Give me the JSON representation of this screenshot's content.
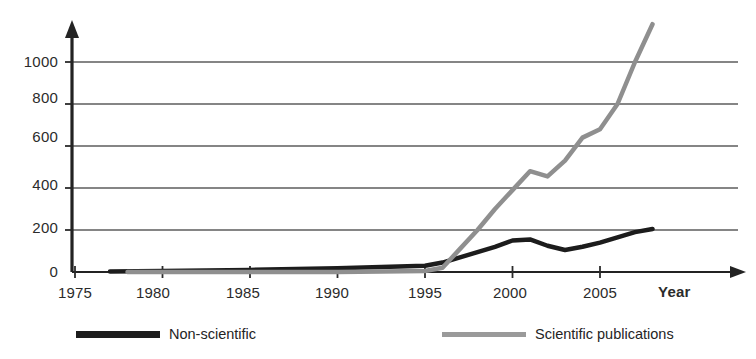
{
  "chart_data": {
    "type": "line",
    "title": "",
    "subtitle": "",
    "xlabel": "Year",
    "ylabel": "",
    "xlim": [
      1975,
      2009
    ],
    "ylim": [
      0,
      1200
    ],
    "grid": "horizontal",
    "legend_position": "bottom",
    "x_ticks": [
      1975,
      1980,
      1985,
      1990,
      1995,
      2000,
      2005
    ],
    "x_tick_labels": [
      "1975",
      "1980",
      "1985",
      "1990",
      "1995",
      "2000",
      "2005"
    ],
    "y_ticks": [
      0,
      200,
      400,
      600,
      800,
      1000
    ],
    "y_tick_labels": [
      "0",
      "200",
      "400",
      "600",
      "800",
      "1000"
    ],
    "series": [
      {
        "name": "Non-scientific",
        "color": "#1c1c1c",
        "stroke_width": 4.5,
        "x": [
          1977,
          1980,
          1985,
          1990,
          1993,
          1995,
          1996,
          1997,
          1998,
          1999,
          2000,
          2001,
          2002,
          2003,
          2004,
          2005,
          2006,
          2007,
          2008
        ],
        "values": [
          2,
          5,
          10,
          18,
          25,
          30,
          45,
          70,
          95,
          120,
          150,
          155,
          125,
          105,
          120,
          140,
          165,
          190,
          205
        ]
      },
      {
        "name": "Scientific publications",
        "color": "#8f8f8f",
        "stroke_width": 4.5,
        "x": [
          1978,
          1990,
          1995,
          1996,
          1997,
          1998,
          1999,
          2000,
          2001,
          2002,
          2003,
          2004,
          2005,
          2006,
          2007,
          2008
        ],
        "values": [
          0,
          0,
          5,
          20,
          110,
          200,
          300,
          390,
          480,
          455,
          530,
          640,
          680,
          800,
          1000,
          1180
        ]
      }
    ]
  },
  "axes": {
    "y_title": "",
    "x_title": "Year"
  },
  "legend": {
    "items": [
      {
        "label": "Non-scientific",
        "swatch": "dark-line-swatch"
      },
      {
        "label": "Scientific publications",
        "swatch": "grey-line-swatch"
      }
    ]
  }
}
